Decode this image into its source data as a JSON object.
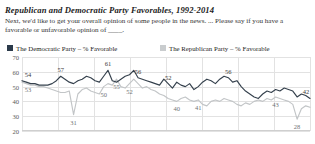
{
  "header": {
    "title": "Republican and Democratic Party Favorables, 1992-2014",
    "subtitle": "Next, we'd like to get your overall opinion of some people in the news. ... Please say if you have a favorable or unfavorable opinion of ____."
  },
  "legend": {
    "position": "top",
    "items": [
      {
        "name": "democratic",
        "label": "The Democratic Party – % Favorable",
        "color": "#2b3a4a"
      },
      {
        "name": "republican",
        "label": "The Republican Party – % Favorable",
        "color": "#c9ccce"
      }
    ]
  },
  "axes": {
    "y_ticks": [
      "70",
      "60",
      "50",
      "40",
      "30",
      "20"
    ],
    "ylim": [
      20,
      70
    ],
    "grid": true
  },
  "chart_data": {
    "type": "line",
    "title": "Republican and Democratic Party Favorables, 1992-2014",
    "subtitle": "Next, we'd like to get your overall opinion of some people in the news. ... Please say if you have a favorable or unfavorable opinion of ____.",
    "xlabel": "",
    "ylabel": "% Favorable",
    "ylim": [
      20,
      70
    ],
    "xlim": [
      1992,
      2014
    ],
    "grid": true,
    "legend_position": "top",
    "series": [
      {
        "name": "The Democratic Party – % Favorable",
        "color": "#35414d",
        "values": [
          54,
          53,
          52,
          52,
          51,
          51,
          51,
          52,
          54,
          57,
          55,
          53,
          52,
          54,
          55,
          57,
          56,
          54,
          53,
          57,
          61,
          54,
          53,
          55,
          57,
          58,
          61,
          56,
          55,
          54,
          53,
          52,
          51,
          55,
          52,
          49,
          53,
          51,
          50,
          52,
          48,
          50,
          53,
          55,
          54,
          52,
          55,
          57,
          56,
          53,
          54,
          50,
          47,
          45,
          43,
          42,
          45,
          47,
          46,
          48,
          47,
          49,
          48,
          47,
          43,
          45,
          44,
          42
        ]
      },
      {
        "name": "The Republican Party – % Favorable",
        "color": "#c2c5c7",
        "values": [
          53,
          52,
          51,
          51,
          50,
          50,
          49,
          48,
          47,
          46,
          46,
          47,
          31,
          45,
          48,
          49,
          47,
          46,
          45,
          50,
          52,
          51,
          55,
          50,
          49,
          52,
          55,
          52,
          49,
          50,
          48,
          47,
          45,
          44,
          42,
          41,
          40,
          42,
          43,
          41,
          40,
          41,
          38,
          37,
          40,
          41,
          40,
          42,
          41,
          40,
          38,
          37,
          39,
          38,
          40,
          41,
          40,
          42,
          41,
          43,
          42,
          41,
          40,
          38,
          28,
          35,
          37,
          36
        ]
      }
    ],
    "point_labels": [
      {
        "series": "democratic",
        "value": "54"
      },
      {
        "series": "democratic",
        "value": "57"
      },
      {
        "series": "democratic",
        "value": "61"
      },
      {
        "series": "democratic",
        "value": "61"
      },
      {
        "series": "democratic",
        "value": "55"
      },
      {
        "series": "democratic",
        "value": "53"
      },
      {
        "series": "democratic",
        "value": "42"
      },
      {
        "series": "republican",
        "value": "53"
      },
      {
        "series": "republican",
        "value": "31"
      },
      {
        "series": "republican",
        "value": "53"
      },
      {
        "series": "republican",
        "value": "55"
      },
      {
        "series": "republican",
        "value": "49"
      },
      {
        "series": "republican",
        "value": "40"
      },
      {
        "series": "republican",
        "value": "41"
      },
      {
        "series": "republican",
        "value": "28"
      },
      {
        "series": "republican",
        "value": "43"
      },
      {
        "series": "republican",
        "value": "36"
      }
    ]
  }
}
